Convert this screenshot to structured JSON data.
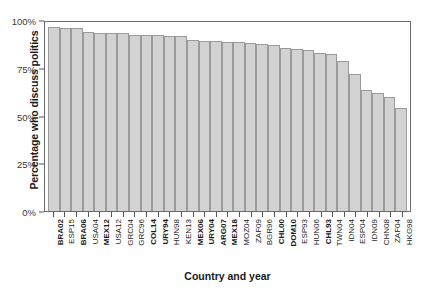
{
  "chart_data": {
    "type": "bar",
    "title": "",
    "xlabel": "Country and year",
    "ylabel": "Percentage who discuss politics",
    "ylim": [
      0,
      100
    ],
    "yticks": [
      0,
      25,
      50,
      75,
      100
    ],
    "ytick_labels": [
      "0%",
      "25%",
      "50%",
      "75%",
      "100%"
    ],
    "grid": false,
    "legend": null,
    "bar_color": "#d2d2d2",
    "bar_edge_color": "#9a9a9a",
    "categories": [
      "BRA02",
      "ESP15",
      "BRA06",
      "USA04",
      "MEX12",
      "USA12",
      "GRC04",
      "GRC96",
      "COL14",
      "URY94",
      "HUN98",
      "KEN13",
      "MEX06",
      "URY04",
      "ARG07",
      "MEX18",
      "MOZ04",
      "ZAF09",
      "BGR96",
      "CHL00",
      "DOM10",
      "ESP93",
      "HUN06",
      "CHL93",
      "TWN04",
      "IDN04",
      "ESP04",
      "IDN09",
      "CHN08",
      "ZAF04",
      "HKG98"
    ],
    "values": [
      96.3,
      96.0,
      95.8,
      93.5,
      93.3,
      93.2,
      93.0,
      92.2,
      92.0,
      91.9,
      91.8,
      91.6,
      89.3,
      89.0,
      88.8,
      88.6,
      88.3,
      87.8,
      87.5,
      87.0,
      85.5,
      84.8,
      84.5,
      82.8,
      82.0,
      78.5,
      71.8,
      63.5,
      62.0,
      59.5,
      54.0
    ],
    "bold_categories": [
      "BRA02",
      "BRA06",
      "MEX12",
      "COL14",
      "URY94",
      "MEX06",
      "URY04",
      "ARG07",
      "MEX18",
      "CHL00",
      "DOM10",
      "CHL93"
    ]
  }
}
